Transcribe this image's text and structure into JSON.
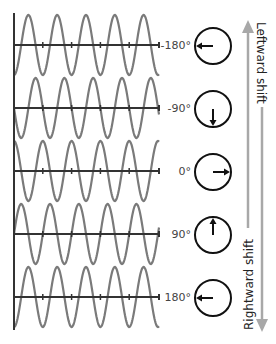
{
  "rows": [
    {
      "label": "-180°",
      "phase_deg": -180,
      "pointer": "left"
    },
    {
      "label": "-90°",
      "phase_deg": -90,
      "pointer": "down"
    },
    {
      "label": "0°",
      "phase_deg": 0,
      "pointer": "right"
    },
    {
      "label": "90°",
      "phase_deg": 90,
      "pointer": "up"
    },
    {
      "label": "180°",
      "phase_deg": 180,
      "pointer": "left"
    }
  ],
  "arrows": {
    "leftward_label": "Leftward shift",
    "rightward_label": "Rightward shift"
  },
  "colors": {
    "wave": "#7a7a7a",
    "axis": "#333333",
    "circle": "#111111",
    "arrow": "#a8a8a8"
  },
  "geometry": {
    "axis_x": 14,
    "wave_end_x": 159,
    "baselines_y": [
      45,
      108,
      171,
      234,
      297
    ],
    "amplitude": 30,
    "period_px": 28.8,
    "circle_cx": 213,
    "circle_r": 18
  }
}
